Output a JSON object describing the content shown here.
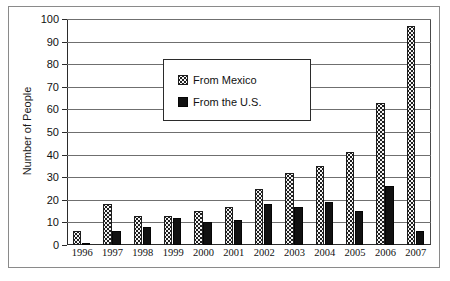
{
  "chart_data": {
    "type": "bar",
    "title": "",
    "xlabel": "",
    "ylabel": "Number of People",
    "ylim": [
      0,
      100
    ],
    "ytick_step": 10,
    "grid": true,
    "legend_position": "upper-left-inside",
    "categories": [
      "1996",
      "1997",
      "1998",
      "1999",
      "2000",
      "2001",
      "2002",
      "2003",
      "2004",
      "2005",
      "2006",
      "2007"
    ],
    "yticks": [
      "0",
      "10",
      "20",
      "30",
      "40",
      "50",
      "60",
      "70",
      "80",
      "90",
      "100"
    ],
    "series": [
      {
        "name": "From Mexico",
        "pattern": "dotted",
        "values": [
          6,
          18,
          13,
          13,
          15,
          17,
          25,
          32,
          35,
          41,
          63,
          97
        ]
      },
      {
        "name": "From the U.S.",
        "pattern": "solid-black",
        "values": [
          1,
          6,
          8,
          12,
          10,
          11,
          18,
          17,
          19,
          15,
          26,
          6
        ]
      }
    ]
  },
  "legend": {
    "items": [
      {
        "label": "From Mexico"
      },
      {
        "label": "From the U.S."
      }
    ]
  },
  "caption": ""
}
